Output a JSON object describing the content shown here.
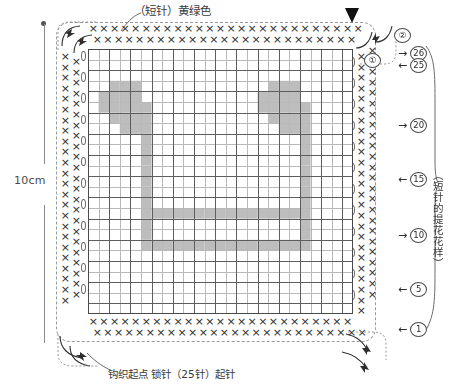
{
  "meta": {
    "colors": {
      "grid_line": "#5d5d5d",
      "grid_line_minor": "#b9b9b9",
      "shaded_cell": "#bdbdbd",
      "symbol": "#2e2e2e",
      "frame_dash": "#9a9a9a",
      "end_marker": "#111111"
    }
  },
  "annotations": {
    "top_label": "（短针）黄绿色",
    "bottom_label": "钩织起点 锁针（25针）起针",
    "right_label": "（短针的提花花样）",
    "left_dimension": "10cm"
  },
  "markers": {
    "row_1_corner": "①",
    "row_2_corner": "②"
  },
  "row_markers": [
    {
      "arrow": "→",
      "number": "26",
      "top": 46
    },
    {
      "arrow": "←",
      "number": "25",
      "top": 58
    },
    {
      "arrow": "→",
      "number": "20",
      "top": 118
    },
    {
      "arrow": "←",
      "number": "15",
      "top": 172
    },
    {
      "arrow": "→",
      "number": "10",
      "top": 228
    },
    {
      "arrow": "←",
      "number": "5",
      "top": 282
    },
    {
      "arrow": "←",
      "number": "1",
      "top": 322
    }
  ],
  "symbols": {
    "single_crochet": "×",
    "chain_stitch": "oval"
  },
  "border_symbol_counts": {
    "top_outer": 26,
    "top_inner": 25,
    "bottom_outer": 26,
    "bottom_inner": 25,
    "left_outer": 24,
    "left_inner": 23,
    "right_outer": 24,
    "right_inner": 25
  },
  "chart_data": {
    "type": "heatmap",
    "title": "（短针的提花花样）",
    "xlabel": "锁针（25针）起针",
    "ylabel": "10cm",
    "grid": true,
    "cols": 25,
    "rows": 25,
    "cell_px": 10.6,
    "legend": [
      {
        "symbol": "×",
        "label": "（短针）黄绿色"
      },
      {
        "symbol": "shaded",
        "label": "提花花样"
      }
    ],
    "x": [
      1,
      2,
      3,
      4,
      5,
      6,
      7,
      8,
      9,
      10,
      11,
      12,
      13,
      14,
      15,
      16,
      17,
      18,
      19,
      20,
      21,
      22,
      23,
      24,
      25
    ],
    "y_tick_labels": [
      "1",
      "5",
      "10",
      "15",
      "20",
      "25",
      "26"
    ],
    "filled_cells": [
      [
        6,
        7
      ],
      [
        7,
        7
      ],
      [
        8,
        7
      ],
      [
        9,
        7
      ],
      [
        10,
        7
      ],
      [
        11,
        7
      ],
      [
        12,
        7
      ],
      [
        13,
        7
      ],
      [
        14,
        7
      ],
      [
        15,
        7
      ],
      [
        16,
        7
      ],
      [
        17,
        7
      ],
      [
        18,
        7
      ],
      [
        19,
        7
      ],
      [
        20,
        7
      ],
      [
        21,
        7
      ],
      [
        6,
        8
      ],
      [
        21,
        8
      ],
      [
        6,
        9
      ],
      [
        21,
        9
      ],
      [
        6,
        10
      ],
      [
        7,
        10
      ],
      [
        8,
        10
      ],
      [
        9,
        10
      ],
      [
        10,
        10
      ],
      [
        11,
        10
      ],
      [
        12,
        10
      ],
      [
        13,
        10
      ],
      [
        14,
        10
      ],
      [
        15,
        10
      ],
      [
        16,
        10
      ],
      [
        17,
        10
      ],
      [
        18,
        10
      ],
      [
        19,
        10
      ],
      [
        20,
        10
      ],
      [
        21,
        10
      ],
      [
        6,
        11
      ],
      [
        21,
        11
      ],
      [
        6,
        12
      ],
      [
        21,
        12
      ],
      [
        6,
        13
      ],
      [
        21,
        13
      ],
      [
        6,
        14
      ],
      [
        21,
        14
      ],
      [
        6,
        15
      ],
      [
        21,
        15
      ],
      [
        6,
        16
      ],
      [
        21,
        16
      ],
      [
        6,
        17
      ],
      [
        21,
        17
      ],
      [
        4,
        18
      ],
      [
        5,
        18
      ],
      [
        6,
        18
      ],
      [
        19,
        18
      ],
      [
        20,
        18
      ],
      [
        21,
        18
      ],
      [
        3,
        19
      ],
      [
        4,
        19
      ],
      [
        5,
        19
      ],
      [
        6,
        19
      ],
      [
        18,
        19
      ],
      [
        19,
        19
      ],
      [
        20,
        19
      ],
      [
        21,
        19
      ],
      [
        2,
        20
      ],
      [
        3,
        20
      ],
      [
        4,
        20
      ],
      [
        5,
        20
      ],
      [
        6,
        20
      ],
      [
        17,
        20
      ],
      [
        18,
        20
      ],
      [
        19,
        20
      ],
      [
        20,
        20
      ],
      [
        21,
        20
      ],
      [
        2,
        21
      ],
      [
        3,
        21
      ],
      [
        4,
        21
      ],
      [
        5,
        21
      ],
      [
        17,
        21
      ],
      [
        18,
        21
      ],
      [
        19,
        21
      ],
      [
        20,
        21
      ],
      [
        3,
        22
      ],
      [
        4,
        22
      ],
      [
        5,
        22
      ],
      [
        18,
        22
      ],
      [
        19,
        22
      ],
      [
        20,
        22
      ]
    ],
    "note": "Shaded cells form two beamed eighth notes (colourwork motif)."
  }
}
